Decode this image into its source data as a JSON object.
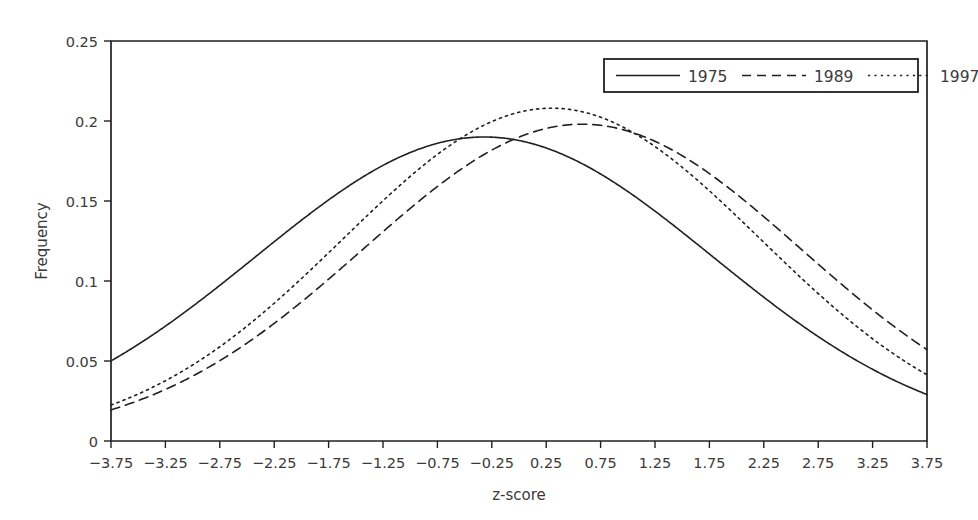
{
  "chart_data": {
    "type": "line",
    "title": "",
    "xlabel": "z-score",
    "ylabel": "Frequency",
    "xlim": [
      -3.75,
      3.75
    ],
    "ylim": [
      0,
      0.25
    ],
    "grid": false,
    "legend_position": "top-right",
    "xticks": [
      "−3.75",
      "−3.25",
      "−2.75",
      "−2.25",
      "−1.75",
      "−1.25",
      "−0.75",
      "−0.25",
      "0.25",
      "0.75",
      "1.25",
      "1.75",
      "2.25",
      "2.75",
      "3.25",
      "3.75"
    ],
    "xtick_values": [
      -3.75,
      -3.25,
      -2.75,
      -2.25,
      -1.75,
      -1.25,
      -0.75,
      -0.25,
      0.25,
      0.75,
      1.25,
      1.75,
      2.25,
      2.75,
      3.25,
      3.75
    ],
    "yticks": [
      "0",
      "0.05",
      "0.1",
      "0.15",
      "0.2",
      "0.25"
    ],
    "ytick_values": [
      0,
      0.05,
      0.1,
      0.15,
      0.2,
      0.25
    ],
    "x": [
      -3.75,
      -3.5,
      -3.25,
      -3.0,
      -2.75,
      -2.5,
      -2.25,
      -2.0,
      -1.75,
      -1.5,
      -1.25,
      -1.0,
      -0.75,
      -0.5,
      -0.25,
      0.0,
      0.25,
      0.5,
      0.75,
      1.0,
      1.25,
      1.5,
      1.75,
      2.0,
      2.25,
      2.5,
      2.75,
      3.0,
      3.25,
      3.5,
      3.75
    ],
    "series": [
      {
        "name": "1975",
        "style": "solid",
        "mean": -0.32,
        "sigma": 2.1,
        "peak": 0.19,
        "values": [
          0.0055,
          0.0086,
          0.0128,
          0.0185,
          0.0257,
          0.0345,
          0.0448,
          0.0562,
          0.0681,
          0.0799,
          0.0906,
          0.0997,
          0.1064,
          0.1103,
          0.1113,
          0.1095,
          0.1051,
          0.0986,
          0.0906,
          0.0816,
          0.0722,
          0.0628,
          0.0537,
          0.0452,
          0.0374,
          0.0305,
          0.0245,
          0.0194,
          0.0151,
          0.0116,
          0.0088
        ]
      },
      {
        "name": "1989",
        "style": "dashed",
        "mean": 0.58,
        "sigma": 2.01,
        "peak": 0.198,
        "values": [
          0.0017,
          0.0029,
          0.0048,
          0.0077,
          0.0118,
          0.0175,
          0.0251,
          0.0347,
          0.0463,
          0.0595,
          0.0736,
          0.0877,
          0.1006,
          0.1113,
          0.1186,
          0.122,
          0.1212,
          0.1164,
          0.1081,
          0.0972,
          0.0847,
          0.0716,
          0.0587,
          0.0467,
          0.036,
          0.0269,
          0.0195,
          0.0137,
          0.0094,
          0.0062,
          0.004
        ]
      },
      {
        "name": "1997",
        "style": "dotted",
        "mean": 0.3,
        "sigma": 1.92,
        "peak": 0.208,
        "values": [
          0.0023,
          0.004,
          0.0065,
          0.0102,
          0.0153,
          0.0222,
          0.031,
          0.0418,
          0.0543,
          0.0679,
          0.0818,
          0.0949,
          0.1059,
          0.1138,
          0.1178,
          0.1178,
          0.114,
          0.1069,
          0.0974,
          0.0864,
          0.0747,
          0.0631,
          0.0522,
          0.0422,
          0.0334,
          0.0259,
          0.0196,
          0.0145,
          0.0105,
          0.0074,
          0.0051
        ]
      }
    ],
    "legend": [
      {
        "label": "1975",
        "style": "solid"
      },
      {
        "label": "1989",
        "style": "dashed"
      },
      {
        "label": "1997",
        "style": "dotted"
      }
    ]
  }
}
